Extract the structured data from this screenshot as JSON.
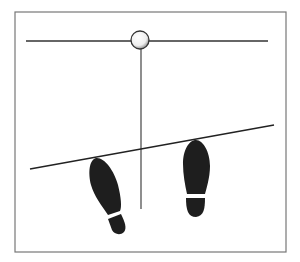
{
  "diagram": {
    "frame": {
      "x": 15,
      "y": 12,
      "w": 271,
      "h": 240,
      "stroke": "#777777"
    },
    "top_line": {
      "x1": 26,
      "y1": 41,
      "x2": 268,
      "y2": 41
    },
    "ball": {
      "cx": 140,
      "cy": 40,
      "r": 9
    },
    "plumb_line": {
      "x1": 141,
      "y1": 50,
      "x2": 141,
      "y2": 209
    },
    "slope_line": {
      "x1": 30,
      "y1": 169,
      "x2": 274,
      "y2": 125
    },
    "colors": {
      "ink": "#222222",
      "shoe": "#1e1e1e",
      "bg": "#ffffff"
    }
  }
}
